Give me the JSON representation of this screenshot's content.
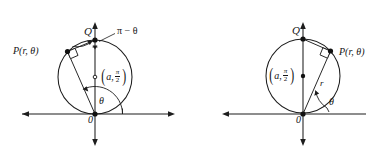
{
  "figure": {
    "name": "polar-circle-diagrams",
    "background_color": "#ffffff",
    "ink_color": "#1d1d1d"
  },
  "panels": [
    {
      "id": "left-panel",
      "name": "left-diagram",
      "labels": {
        "point_p": "P(r, θ)",
        "point_q": "Q",
        "origin": "0",
        "angle_theta": "θ",
        "angle_supplement": "π − θ",
        "center_a": "a",
        "center_fraction_numerator": "π",
        "center_fraction_denominator": "2"
      },
      "geometry": {
        "origin": [
          95,
          114
        ],
        "circle_center": [
          95,
          77
        ],
        "circle_radius": 37,
        "point_q": [
          95,
          40
        ],
        "point_p": [
          67.5,
          51.5
        ],
        "x_axis": [
          15,
          175
        ],
        "y_axis": [
          22,
          146
        ]
      }
    },
    {
      "id": "right-panel",
      "name": "right-diagram",
      "labels": {
        "point_p": "P(r, θ)",
        "point_q": "Q",
        "origin": "0",
        "angle_theta": "θ",
        "segment_r": "r",
        "center_a": "a",
        "center_fraction_numerator": "π",
        "center_fraction_denominator": "2"
      },
      "geometry": {
        "origin": [
          303,
          114
        ],
        "circle_center": [
          303,
          76
        ],
        "circle_radius": 37,
        "point_q": [
          303,
          39
        ],
        "point_p": [
          330.5,
          51
        ],
        "x_axis": [
          222,
          366
        ],
        "y_axis": [
          22,
          146
        ]
      }
    }
  ]
}
